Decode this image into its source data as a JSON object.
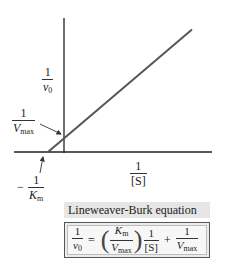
{
  "diagram": {
    "y_axis_label": {
      "numerator": "1",
      "denominator": "v",
      "denominator_sub": "0"
    },
    "x_axis_label": {
      "numerator": "1",
      "denominator": "[S]"
    },
    "y_intercept_label": {
      "numerator": "1",
      "denominator": "V",
      "denominator_sub": "max"
    },
    "x_intercept_label": {
      "sign": "−",
      "numerator": "1",
      "denominator": "K",
      "denominator_sub": "m"
    }
  },
  "equation": {
    "title": "Lineweaver-Burk equation",
    "lhs": {
      "numerator": "1",
      "denominator": "v",
      "denominator_sub": "0"
    },
    "equals": "=",
    "slope": {
      "numerator": "K",
      "numerator_sub": "m",
      "denominator": "V",
      "denominator_sub": "max"
    },
    "term": {
      "numerator": "1",
      "denominator": "[S]"
    },
    "plus": "+",
    "intercept": {
      "numerator": "1",
      "denominator": "V",
      "denominator_sub": "max"
    }
  },
  "chart_data": {
    "type": "line",
    "title": "",
    "xlabel": "1/[S]",
    "ylabel": "1/v0",
    "series": [
      {
        "name": "Lineweaver-Burk line",
        "x": [
          -1,
          8
        ],
        "y": [
          0,
          7
        ]
      }
    ],
    "annotations": [
      "1/Vmax (y-intercept)",
      "-1/Km (x-intercept)"
    ],
    "xlim": [
      -3,
      9
    ],
    "ylim": [
      0,
      8
    ],
    "grid": false
  }
}
